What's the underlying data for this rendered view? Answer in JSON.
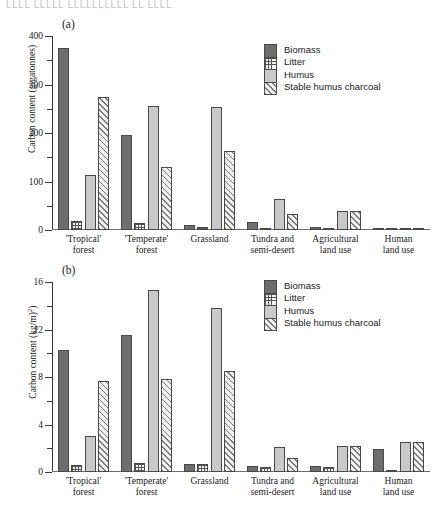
{
  "header_fragment": "LLLL LLLLL LLLLLLLLLL LL LLLL",
  "legend": {
    "items": [
      {
        "label": "Biomass",
        "key": "biomass",
        "swatch": "solid-dark-gray",
        "color": "#6e6e6e"
      },
      {
        "label": "Litter",
        "key": "litter",
        "swatch": "cross-hatch",
        "color": "#f2f2f2"
      },
      {
        "label": "Humus",
        "key": "humus",
        "swatch": "solid-light-gray",
        "color": "#c9c9c9"
      },
      {
        "label": "Stable humus charcoal",
        "key": "charcoal",
        "swatch": "diagonal-hatch",
        "color": "#f0f0f0"
      }
    ]
  },
  "chart_data": [
    {
      "panel": "(a)",
      "type": "bar",
      "title": "",
      "xlabel": "",
      "ylabel": "Carbon content (gigatonnes)",
      "ylim": [
        0,
        400
      ],
      "yticks": [
        0,
        100,
        200,
        300,
        400
      ],
      "yticklabels": [
        "0",
        "100",
        "200",
        "300",
        "400"
      ],
      "yminorticks": [
        50,
        150,
        250,
        350
      ],
      "grid": false,
      "legend_position": "top-right",
      "categories": [
        "'Tropical'\nforest",
        "'Temperate'\nforest",
        "Grassland",
        "Tundra and\nsemi-desert",
        "Agricultural\nland use",
        "Human\nland use"
      ],
      "series": [
        {
          "name": "Biomass",
          "values": [
            375,
            195,
            10,
            16,
            7,
            3
          ]
        },
        {
          "name": "Litter",
          "values": [
            18,
            15,
            7,
            4,
            3,
            1
          ]
        },
        {
          "name": "Humus",
          "values": [
            113,
            255,
            253,
            64,
            40,
            5
          ]
        },
        {
          "name": "Stable humus charcoal",
          "values": [
            275,
            130,
            162,
            32,
            40,
            5
          ]
        }
      ]
    },
    {
      "panel": "(b)",
      "type": "bar",
      "title": "",
      "xlabel": "",
      "ylabel": "Carbon content (kg/m2)",
      "ylim": [
        0,
        16
      ],
      "yticks": [
        0,
        4,
        8,
        12,
        16
      ],
      "yticklabels": [
        "0",
        "4",
        "8",
        "12",
        "16"
      ],
      "yminorticks": [
        2,
        6,
        10,
        14
      ],
      "grid": false,
      "legend_position": "top-right",
      "categories": [
        "'Tropical'\nforest",
        "'Temperate'\nforest",
        "Grassland",
        "Tundra and\nsemi-desert",
        "Agricultural\nland use",
        "Human\nland use"
      ],
      "series": [
        {
          "name": "Biomass",
          "values": [
            10.3,
            11.5,
            0.7,
            0.5,
            0.5,
            1.9
          ]
        },
        {
          "name": "Litter",
          "values": [
            0.6,
            0.8,
            0.7,
            0.4,
            0.4,
            0.2
          ]
        },
        {
          "name": "Humus",
          "values": [
            3.0,
            15.3,
            13.8,
            2.1,
            2.2,
            2.5
          ]
        },
        {
          "name": "Stable humus charcoal",
          "values": [
            7.7,
            7.8,
            8.5,
            1.2,
            2.2,
            2.5
          ]
        }
      ]
    }
  ]
}
